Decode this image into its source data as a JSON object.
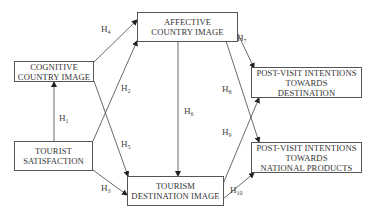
{
  "diagram": {
    "nodes": {
      "affective": {
        "label": "AFFECTIVE\nCOUNTRY IMAGE"
      },
      "cognitive": {
        "label": "COGNITIVE\nCOUNTRY IMAGE"
      },
      "satisfaction": {
        "label": "TOURIST\nSATISFACTION"
      },
      "destination_image": {
        "label": "TOURISM\nDESTINATION IMAGE"
      },
      "pv_destination": {
        "label": "POST-VISIT INTENTIONS\nTOWARDS\nDESTINATION"
      },
      "pv_products": {
        "label": "POST-VISIT INTENTIONS\nTOWARDS\nNATIONAL PRODUCTS"
      }
    },
    "hypotheses": [
      {
        "id": "H",
        "num": "1",
        "from": "TOURIST SATISFACTION",
        "to": "COGNITIVE COUNTRY IMAGE"
      },
      {
        "id": "H",
        "num": "2",
        "from": "TOURIST SATISFACTION",
        "to": "AFFECTIVE COUNTRY IMAGE"
      },
      {
        "id": "H",
        "num": "3",
        "from": "TOURIST SATISFACTION",
        "to": "TOURISM DESTINATION IMAGE"
      },
      {
        "id": "H",
        "num": "4",
        "from": "COGNITIVE COUNTRY IMAGE",
        "to": "AFFECTIVE COUNTRY IMAGE"
      },
      {
        "id": "H",
        "num": "5",
        "from": "COGNITIVE COUNTRY IMAGE",
        "to": "TOURISM DESTINATION IMAGE"
      },
      {
        "id": "H",
        "num": "6",
        "from": "AFFECTIVE COUNTRY IMAGE",
        "to": "TOURISM DESTINATION IMAGE"
      },
      {
        "id": "H",
        "num": "7",
        "from": "AFFECTIVE COUNTRY IMAGE",
        "to": "POST-VISIT INTENTIONS TOWARDS DESTINATION"
      },
      {
        "id": "H",
        "num": "8",
        "from": "AFFECTIVE COUNTRY IMAGE",
        "to": "POST-VISIT INTENTIONS TOWARDS NATIONAL PRODUCTS"
      },
      {
        "id": "H",
        "num": "9",
        "from": "TOURISM DESTINATION IMAGE",
        "to": "POST-VISIT INTENTIONS TOWARDS DESTINATION"
      },
      {
        "id": "H",
        "num": "10",
        "from": "TOURISM DESTINATION IMAGE",
        "to": "POST-VISIT INTENTIONS TOWARDS NATIONAL PRODUCTS"
      }
    ],
    "colors": {
      "line": "#333333",
      "border": "#555555",
      "text": "#333333"
    }
  }
}
